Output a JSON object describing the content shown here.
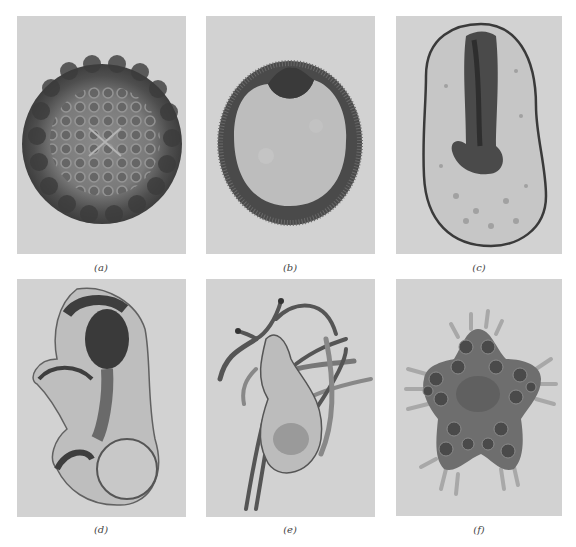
{
  "figure": {
    "background": "#ffffff",
    "panel_background": "#d2d2d2",
    "panels": [
      {
        "id": "a",
        "label": "(a)",
        "subject": "spherical embryo with polygonal cell surface"
      },
      {
        "id": "b",
        "label": "(b)",
        "subject": "oval embryo with invaginating dark cap"
      },
      {
        "id": "c",
        "label": "(c)",
        "subject": "elongated oval larva with dark internal gut"
      },
      {
        "id": "d",
        "label": "(d)",
        "subject": "translucent curved larva with dark stomach"
      },
      {
        "id": "e",
        "label": "(e)",
        "subject": "larva with long slender arms"
      },
      {
        "id": "f",
        "label": "(f)",
        "subject": "five-pointed juvenile with tubercles and spines"
      }
    ]
  }
}
